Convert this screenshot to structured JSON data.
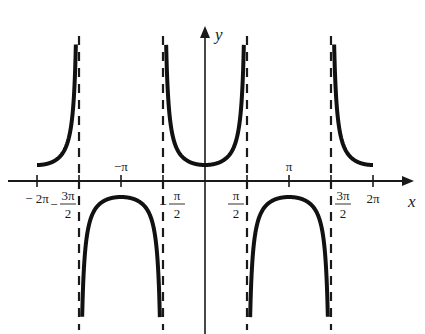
{
  "chart_data": {
    "type": "line",
    "title": "",
    "function": "y = sec x",
    "xlabel": "x",
    "ylabel": "y",
    "xlim": [
      -6.283,
      6.283
    ],
    "ylim": [
      -9,
      9
    ],
    "grid": false,
    "legend": null,
    "x_ticks": [
      {
        "value": -6.283,
        "label": "− 2π",
        "frac": false
      },
      {
        "value": -4.712,
        "num": "3π",
        "den": "2",
        "sign": "−",
        "frac": true
      },
      {
        "value": -3.1416,
        "label": "−π",
        "frac": false,
        "above": true
      },
      {
        "value": -1.5708,
        "num": "π",
        "den": "2",
        "sign": "−",
        "frac": true
      },
      {
        "value": 1.5708,
        "num": "π",
        "den": "2",
        "sign": "",
        "frac": true
      },
      {
        "value": 3.1416,
        "label": "π",
        "frac": false,
        "above": true
      },
      {
        "value": 4.712,
        "num": "3π",
        "den": "2",
        "sign": "",
        "frac": true
      },
      {
        "value": 6.283,
        "label": "2π",
        "frac": false
      }
    ],
    "asymptotes": [
      -4.712,
      -1.5708,
      1.5708,
      4.712
    ],
    "branches": [
      {
        "x_range": [
          -6.283,
          -4.712
        ],
        "sign": 1,
        "description": "from (−2π, 1) rising to +∞ at −3π/2"
      },
      {
        "x_range": [
          -4.712,
          -1.5708
        ],
        "sign": -1,
        "description": "downward U with max (−π, −1)"
      },
      {
        "x_range": [
          -1.5708,
          1.5708
        ],
        "sign": 1,
        "description": "upward U with min (0, 1)"
      },
      {
        "x_range": [
          1.5708,
          4.712
        ],
        "sign": -1,
        "description": "downward U with max (π, −1)"
      },
      {
        "x_range": [
          4.712,
          6.283
        ],
        "sign": 1,
        "description": "from +∞ at 3π/2 falling to (2π, 1)"
      }
    ],
    "key_points": [
      {
        "x": -6.283,
        "y": 1
      },
      {
        "x": -3.1416,
        "y": -1
      },
      {
        "x": 0,
        "y": 1
      },
      {
        "x": 3.1416,
        "y": -1
      },
      {
        "x": 6.283,
        "y": 1
      }
    ],
    "colors": {
      "curve": "#111111",
      "axes": "#1a1a1a",
      "asymptote": "#1a1a1a",
      "background": "#ffffff"
    }
  },
  "labels": {
    "x_axis": "x",
    "y_axis": "y"
  }
}
